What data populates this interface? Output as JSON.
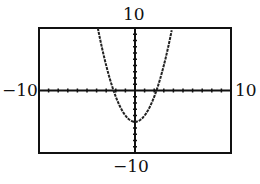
{
  "chart_data": {
    "type": "line",
    "title": "",
    "xlabel": "",
    "ylabel": "",
    "function": "y = x^2 - 5",
    "xlim": [
      -10,
      10
    ],
    "ylim": [
      -10,
      10
    ],
    "xscale": 1,
    "yscale": 1,
    "grid": false,
    "series": [
      {
        "name": "parabola",
        "x": [
          -3.87,
          -3,
          -2.24,
          -1,
          0,
          1,
          2.24,
          3,
          3.87
        ],
        "values": [
          10,
          4,
          0,
          -4,
          -5,
          -4,
          0,
          4,
          10
        ]
      }
    ],
    "window_labels": {
      "ymax": "10",
      "ymin": "-10",
      "xmin": "-10",
      "xmax": "10"
    }
  },
  "labels": {
    "ymax": "10",
    "ymin": "−10",
    "xmin": "−10",
    "xmax": "10"
  }
}
